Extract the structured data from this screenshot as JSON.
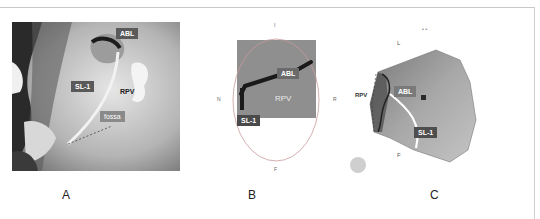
{
  "figure": {
    "panels": [
      {
        "id": "A",
        "letter": "A",
        "labels": {
          "abl": "ABL",
          "sl1": "SL-1",
          "rpv": "RPV",
          "fossa": "fossa"
        }
      },
      {
        "id": "B",
        "letter": "B",
        "labels": {
          "abl": "ABL",
          "rpv": "RPV",
          "sl1": "SL-1"
        },
        "orientation": {
          "top": "I",
          "bottom": "F",
          "left": "N",
          "right": "R"
        }
      },
      {
        "id": "C",
        "letter": "C",
        "labels": {
          "abl": "ABL",
          "rpv": "RPV",
          "sl1": "SL-1"
        },
        "orientation": {
          "top": "L",
          "bottom": "F"
        }
      }
    ],
    "colors": {
      "tag_bg": "#5a5a5a",
      "panel_b_bg": "#8f8f8f",
      "ellipse": "#c89a9a"
    }
  }
}
